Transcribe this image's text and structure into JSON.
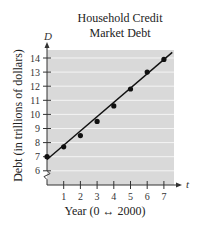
{
  "chart_data": {
    "type": "scatter",
    "title": "Household Credit Market Debt",
    "title_lines": [
      "Household Credit",
      "Market Debt"
    ],
    "xlabel": "Year (0 ↔ 2000)",
    "ylabel": "Debt (in trillions of dollars)",
    "x_axis_var": "t",
    "y_axis_var": "D",
    "x": [
      0,
      1,
      2,
      3,
      4,
      5,
      6,
      7
    ],
    "values": [
      7.0,
      7.7,
      8.5,
      9.5,
      10.6,
      11.8,
      13.0,
      13.9
    ],
    "trendline": {
      "type": "linear",
      "x": [
        0,
        7.5
      ],
      "y": [
        6.8,
        14.4
      ]
    },
    "x_ticks": [
      1,
      2,
      3,
      4,
      5,
      6,
      7
    ],
    "y_ticks": [
      6,
      7,
      8,
      9,
      10,
      11,
      12,
      13,
      14
    ],
    "xlim": [
      0,
      7.5
    ],
    "ylim": [
      5,
      14.5
    ],
    "y_axis_break": true,
    "grid": "horizontal",
    "background": "#d9d9d9",
    "legend": null
  }
}
